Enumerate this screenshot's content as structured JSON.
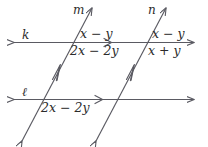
{
  "figure": {
    "type": "geometry-diagram",
    "stroke_color": "#5a5a62",
    "text_color": "#2b2b2b",
    "background": "#ffffff"
  },
  "lines": {
    "horizontal": [
      {
        "name": "k",
        "label": "k"
      },
      {
        "name": "l",
        "label": "ℓ"
      }
    ],
    "transversals": [
      {
        "name": "m",
        "label": "m"
      },
      {
        "name": "n",
        "label": "n"
      }
    ]
  },
  "angle_labels": {
    "k_m_above_right": "x − y",
    "k_m_below_right": "2x − 2y",
    "k_n_above_right": "x − y",
    "k_n_below_right": "x + y",
    "l_m_below_right": "2x − 2y"
  },
  "markers": {
    "parallel_tick_horizontal": "arrow-tick-right",
    "parallel_tick_transversal": "arrow-tick-up"
  }
}
